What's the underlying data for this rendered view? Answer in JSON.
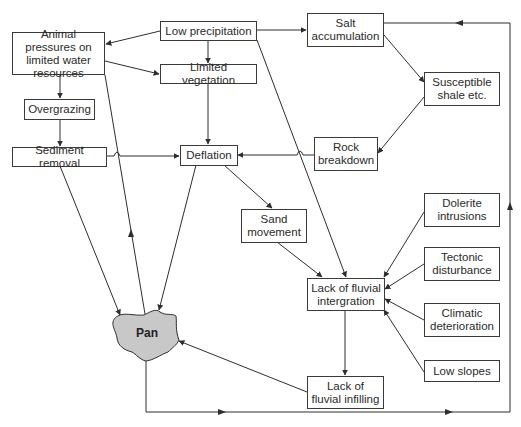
{
  "diagram": {
    "title": "",
    "nodes": [
      {
        "id": "low_precipitation",
        "label": "Low precipitation"
      },
      {
        "id": "salt_accumulation",
        "label": "Salt accumulation"
      },
      {
        "id": "animal_pressures",
        "label": "Animal pressures on limited water resources"
      },
      {
        "id": "limited_vegetation",
        "label": "Limited vegetation"
      },
      {
        "id": "susceptible_shale",
        "label": "Susceptible shale etc."
      },
      {
        "id": "overgrazing",
        "label": "Overgrazing"
      },
      {
        "id": "sediment_removal",
        "label": "Sediment removal"
      },
      {
        "id": "deflation",
        "label": "Deflation"
      },
      {
        "id": "rock_breakdown",
        "label": "Rock breakdown"
      },
      {
        "id": "sand_movement",
        "label": "Sand movement"
      },
      {
        "id": "dolerite_intrusions",
        "label": "Dolerite intrusions"
      },
      {
        "id": "tectonic_disturbance",
        "label": "Tectonic disturbance"
      },
      {
        "id": "lack_fluvial_integration",
        "label": "Lack of fluvial intergration"
      },
      {
        "id": "climatic_deterioration",
        "label": "Climatic deterioration"
      },
      {
        "id": "low_slopes",
        "label": "Low slopes"
      },
      {
        "id": "pan",
        "label": "Pan"
      },
      {
        "id": "lack_fluvial_infilling",
        "label": "Lack of fluvial infilling"
      }
    ],
    "edges": [
      {
        "from": "low_precipitation",
        "to": "animal_pressures"
      },
      {
        "from": "low_precipitation",
        "to": "limited_vegetation"
      },
      {
        "from": "low_precipitation",
        "to": "salt_accumulation"
      },
      {
        "from": "low_precipitation",
        "to": "lack_fluvial_integration"
      },
      {
        "from": "animal_pressures",
        "to": "limited_vegetation"
      },
      {
        "from": "animal_pressures",
        "to": "overgrazing"
      },
      {
        "from": "overgrazing",
        "to": "sediment_removal"
      },
      {
        "from": "sediment_removal",
        "to": "deflation"
      },
      {
        "from": "sediment_removal",
        "to": "pan"
      },
      {
        "from": "limited_vegetation",
        "to": "deflation"
      },
      {
        "from": "salt_accumulation",
        "to": "susceptible_shale"
      },
      {
        "from": "susceptible_shale",
        "to": "rock_breakdown"
      },
      {
        "from": "rock_breakdown",
        "to": "deflation"
      },
      {
        "from": "deflation",
        "to": "sand_movement"
      },
      {
        "from": "deflation",
        "to": "pan"
      },
      {
        "from": "pan",
        "to": "animal_pressures"
      },
      {
        "from": "sand_movement",
        "to": "lack_fluvial_integration"
      },
      {
        "from": "dolerite_intrusions",
        "to": "lack_fluvial_integration"
      },
      {
        "from": "tectonic_disturbance",
        "to": "lack_fluvial_integration"
      },
      {
        "from": "climatic_deterioration",
        "to": "lack_fluvial_integration"
      },
      {
        "from": "low_slopes",
        "to": "lack_fluvial_integration"
      },
      {
        "from": "lack_fluvial_integration",
        "to": "lack_fluvial_infilling"
      },
      {
        "from": "lack_fluvial_infilling",
        "to": "pan"
      },
      {
        "from": "pan",
        "to": "salt_accumulation"
      }
    ],
    "colors": {
      "line": "#2e2e2e",
      "box_border": "#3a3a3a",
      "pan_fill": "#c8c8c8",
      "background": "#ffffff"
    }
  }
}
